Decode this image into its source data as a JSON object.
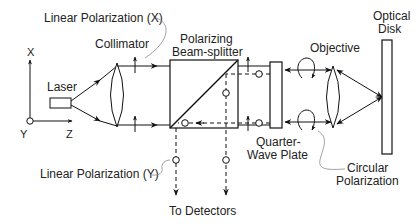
{
  "diagram": {
    "colors": {
      "line": "#111111",
      "label": "#222222",
      "leader": "#888888"
    },
    "axes": {
      "x_label": "X",
      "y_label": "Y",
      "z_label": "Z"
    },
    "components": {
      "laser": "Laser",
      "collimator": "Collimator",
      "beam_splitter_line1": "Polarizing",
      "beam_splitter_line2": "Beam-splitter",
      "quarter_wave_line1": "Quarter-",
      "quarter_wave_line2": "Wave Plate",
      "objective": "Objective",
      "optical_disk_line1": "Optical",
      "optical_disk_line2": "Disk"
    },
    "annotations": {
      "linear_x": "Linear Polarization (X)",
      "linear_y": "Linear Polarization (Y)",
      "circular_line1": "Circular",
      "circular_line2": "Polarization",
      "to_detectors": "To Detectors"
    }
  }
}
